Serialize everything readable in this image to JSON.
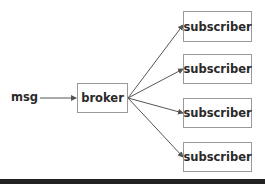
{
  "diagram": {
    "source": {
      "label": "msg"
    },
    "broker": {
      "label": "broker"
    },
    "subscribers": [
      {
        "label": "subscriber"
      },
      {
        "label": "subscriber"
      },
      {
        "label": "subscriber"
      },
      {
        "label": "subscriber"
      }
    ],
    "edges": [
      {
        "from": "msg",
        "to": "broker"
      },
      {
        "from": "broker",
        "to": "subscriber-1"
      },
      {
        "from": "broker",
        "to": "subscriber-2"
      },
      {
        "from": "broker",
        "to": "subscriber-3"
      },
      {
        "from": "broker",
        "to": "subscriber-4"
      }
    ],
    "colors": {
      "line": "#555555",
      "border": "#9a9a9a",
      "text": "#2a2a2a",
      "bottom_bar": "#222222"
    }
  }
}
